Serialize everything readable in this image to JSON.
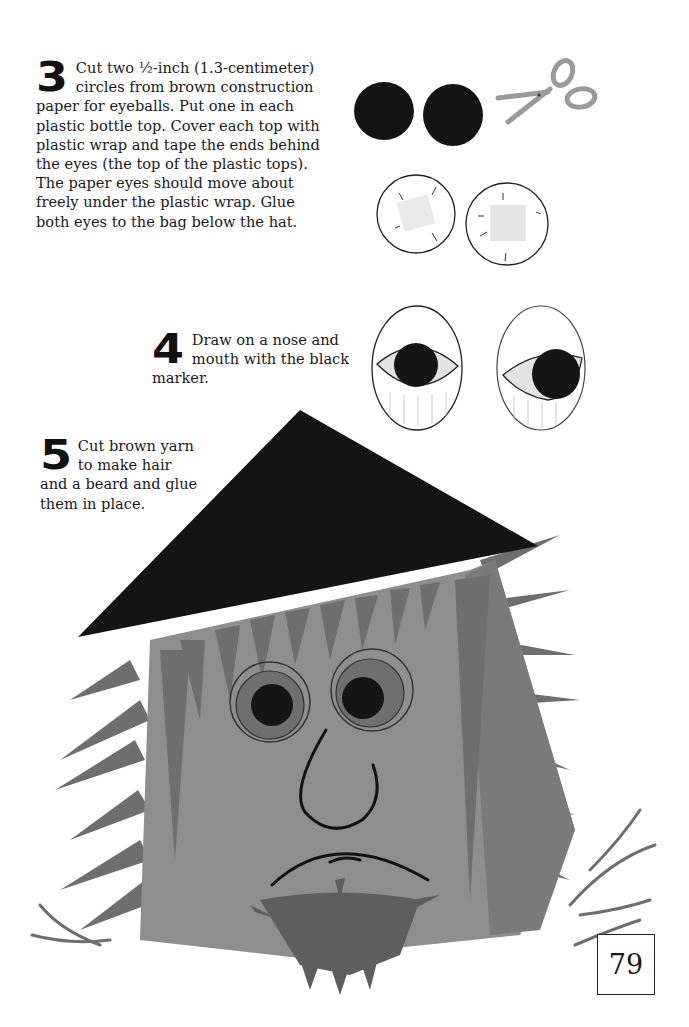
{
  "page": {
    "number": "79",
    "steps": [
      {
        "number": "3",
        "text": "Cut two ½-inch (1.3-centimeter) circles from brown construction paper for eyeballs. Put one in each plastic bottle top. Cover each top with plastic wrap and tape the ends behind the eyes (the top of the plastic tops). The paper eyes should move about freely under the plastic wrap. Glue both eyes to the bag below the hat."
      },
      {
        "number": "4",
        "text": "Draw on a nose and mouth with the black marker."
      },
      {
        "number": "5",
        "text": "Cut brown yarn to make hair and a beard and glue them in place."
      }
    ]
  },
  "illustrations": {
    "paper_circles": "two dark paper circles",
    "scissors": "scissors-icon",
    "wrapped_tops": "two bottle tops covered in plastic wrap",
    "finished_eyes": "two bottle-top eyes with pupils",
    "puppet": "paper bag face with black hat, yarn hair and beard"
  },
  "colors": {
    "bag": "#8e8e8e",
    "hair": "#6e6e6e",
    "hat": "#141414",
    "pupil": "#151515",
    "iris": "#6f6f6f",
    "scissors": "#9a9a9a"
  }
}
